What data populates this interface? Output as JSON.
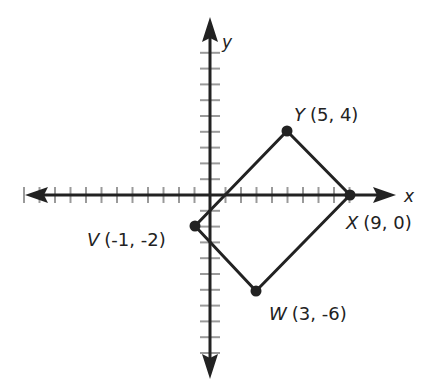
{
  "figure": {
    "type": "coordinate-plane",
    "axes": {
      "x_label": "x",
      "y_label": "y",
      "x_ticks": [
        -12,
        -11,
        -10,
        -9,
        -8,
        -7,
        -6,
        -5,
        -4,
        -3,
        -2,
        -1,
        1,
        2,
        3,
        4,
        5,
        6,
        7,
        8,
        9
      ],
      "y_ticks": [
        -10,
        -9,
        -8,
        -7,
        -6,
        -5,
        -4,
        -3,
        -2,
        -1,
        1,
        2,
        3,
        4,
        5,
        6,
        7,
        8,
        9
      ]
    },
    "shape": "quadrilateral VWXY",
    "points": [
      {
        "name": "Y",
        "coords": "(5, 4)",
        "x": 5,
        "y": 4
      },
      {
        "name": "X",
        "coords": "(9, 0)",
        "x": 9,
        "y": 0
      },
      {
        "name": "W",
        "coords": "(3, -6)",
        "x": 3,
        "y": -6
      },
      {
        "name": "V",
        "coords": "(-1, -2)",
        "x": -1,
        "y": -2
      }
    ],
    "colors": {
      "axis": "#222222",
      "tick": "#9a9a9a",
      "shape": "#222222"
    }
  }
}
